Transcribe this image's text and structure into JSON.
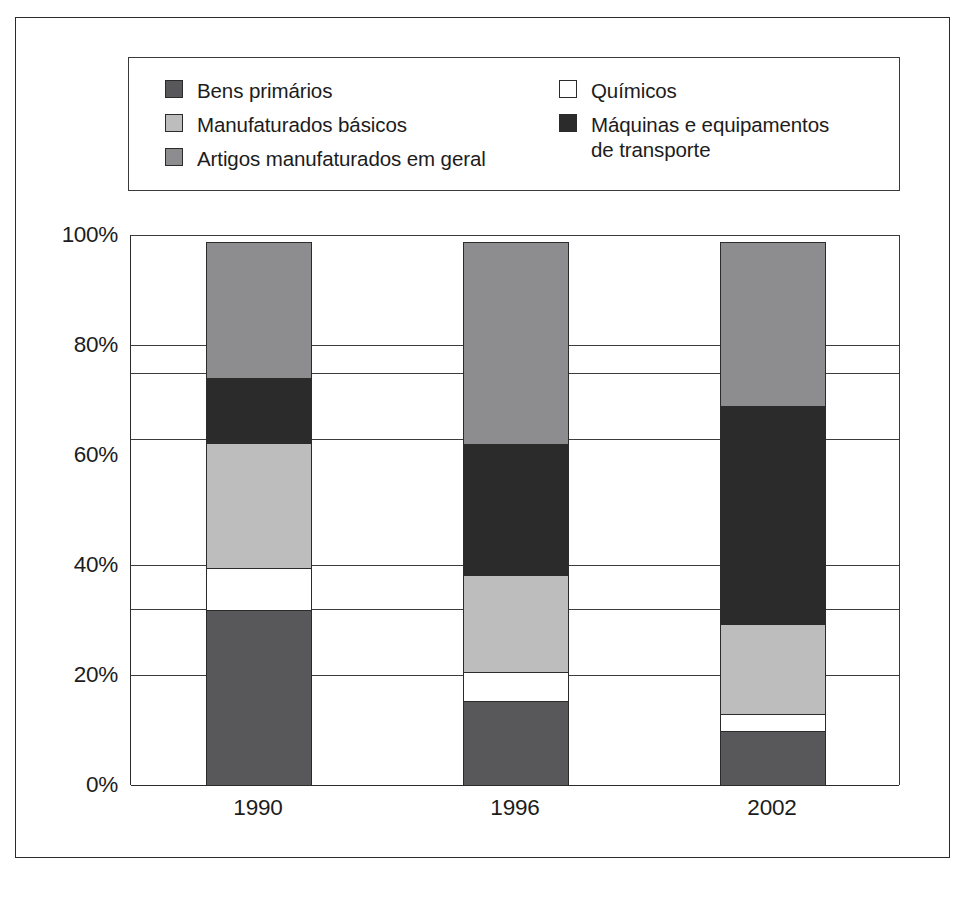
{
  "chart_data": {
    "type": "bar",
    "subtype": "stacked-percent",
    "title": "",
    "xlabel": "",
    "ylabel": "",
    "ylim": [
      0,
      100
    ],
    "ytick_labels": [
      "0%",
      "20%",
      "40%",
      "60%",
      "80%",
      "100%"
    ],
    "ytick_values": [
      0,
      20,
      40,
      60,
      80,
      100
    ],
    "gridlines": [
      0,
      20,
      32,
      40,
      63,
      75,
      80,
      100
    ],
    "grid": true,
    "legend_position": "top",
    "categories": [
      "1990",
      "1996",
      "2002"
    ],
    "series": [
      {
        "name": "Bens primários",
        "color": "#58585a",
        "values": [
          32,
          15.5,
          10
        ]
      },
      {
        "name": "Químicos",
        "color": "#ffffff",
        "values": [
          8,
          5.5,
          3.5
        ]
      },
      {
        "name": "Manufaturados básicos",
        "color": "#bdbdbd",
        "values": [
          23,
          18,
          16.5
        ]
      },
      {
        "name": "Máquinas e equipamentos de transporte",
        "color": "#2b2b2b",
        "values": [
          12,
          24,
          40
        ]
      },
      {
        "name": "Artigos manufaturados em geral",
        "color": "#8d8d8f",
        "values": [
          25,
          37,
          30
        ]
      }
    ]
  },
  "legend": {
    "left_column": [
      {
        "label": "Bens primários",
        "color": "#58585a",
        "swatch": "legend-swatch-bens-primarios"
      },
      {
        "label": "Manufaturados básicos",
        "color": "#bdbdbd",
        "swatch": "legend-swatch-manufaturados-basicos"
      },
      {
        "label": "Artigos manufaturados em geral",
        "color": "#8d8d8f",
        "swatch": "legend-swatch-artigos-manufaturados"
      }
    ],
    "right_column": [
      {
        "label": "Químicos",
        "color": "#ffffff",
        "swatch": "legend-swatch-quimicos"
      },
      {
        "label": "Máquinas e equipamentos\nde transporte",
        "color": "#2b2b2b",
        "swatch": "legend-swatch-maquinas-equipamentos"
      }
    ]
  },
  "axis": {
    "y_labels": [
      "100%",
      "80%",
      "60%",
      "40%",
      "20%",
      "0%"
    ],
    "x_labels": [
      "1990",
      "1996",
      "2002"
    ]
  },
  "colors": {
    "frame": "#2b2b2b",
    "gridline": "#3c3c3c",
    "background": "#ffffff",
    "text": "#1c1c1c"
  }
}
